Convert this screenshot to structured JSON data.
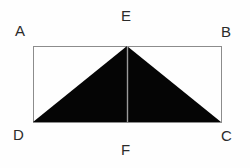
{
  "figure": {
    "background_color": "#fefefe",
    "rectangle": {
      "name": "ABCD",
      "stroke_color": "#8c8c8c",
      "stroke_width": 1,
      "fill": "none",
      "x": 33,
      "y": 46,
      "width": 188,
      "height": 76
    },
    "triangle": {
      "name": "DEC",
      "fill_color": "#050505",
      "points": "33,122 127,46 221,122"
    },
    "median_line": {
      "name": "EF",
      "stroke_color": "#9a9a9a",
      "stroke_width": 1,
      "x1": 127,
      "y1": 46,
      "x2": 127,
      "y2": 122
    },
    "labels": {
      "a": "A",
      "b": "B",
      "c": "C",
      "d": "D",
      "e": "E",
      "f": "F"
    },
    "label_color": "#2b2b2b"
  }
}
